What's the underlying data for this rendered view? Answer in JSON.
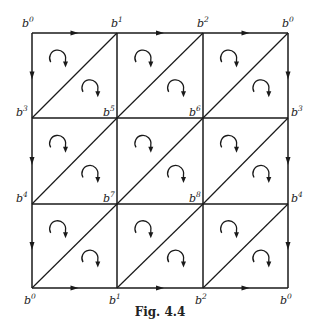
{
  "figure": {
    "caption": "Fig. 4.4",
    "grid_size": 3,
    "vertex_base": "b",
    "vertex_grid": [
      [
        "0",
        "1",
        "2",
        "0"
      ],
      [
        "3",
        "5",
        "6",
        "3"
      ],
      [
        "4",
        "7",
        "8",
        "4"
      ],
      [
        "0",
        "1",
        "2",
        "0"
      ]
    ],
    "edge_orientation": {
      "horizontal_boundary": "right",
      "vertical_boundary": "down"
    },
    "boundary_arrows": {
      "top": true,
      "bottom": true,
      "left": true,
      "right": true
    },
    "triangle_orientation": "clockwise",
    "diagonal_direction": "bottom-left-to-top-right"
  }
}
